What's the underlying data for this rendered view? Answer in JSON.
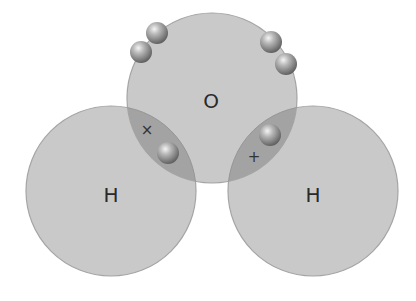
{
  "diagram": {
    "colors": {
      "atom_fill": "#c9c9c9",
      "atom_stroke": "#a5a5a5",
      "overlap_fill": "#a3a3a3",
      "electron": "#8a8a8a",
      "text": "#2a2a2a"
    },
    "atoms": [
      {
        "id": "oxygen",
        "label": "O",
        "cx": 212,
        "cy": 98,
        "r": 85
      },
      {
        "id": "hydrogen-left",
        "label": "H",
        "cx": 111,
        "cy": 191,
        "r": 85
      },
      {
        "id": "hydrogen-right",
        "label": "H",
        "cx": 313,
        "cy": 191,
        "r": 85
      }
    ],
    "lone_pair_electrons": [
      {
        "cx": 157,
        "cy": 33
      },
      {
        "cx": 141,
        "cy": 52
      },
      {
        "cx": 271,
        "cy": 42
      },
      {
        "cx": 286,
        "cy": 64
      }
    ],
    "bonds": [
      {
        "id": "bond-left",
        "marker": "×",
        "marker_x": 147,
        "marker_y": 130,
        "electron": {
          "cx": 168,
          "cy": 153
        }
      },
      {
        "id": "bond-right",
        "marker": "+",
        "marker_x": 254,
        "marker_y": 157,
        "electron": {
          "cx": 270,
          "cy": 135
        }
      }
    ]
  }
}
